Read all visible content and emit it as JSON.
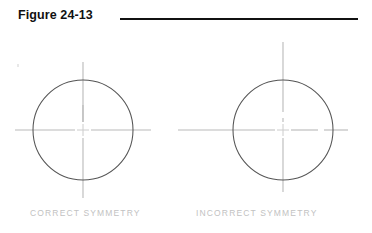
{
  "figure": {
    "title": "Figure 24-13",
    "rule_color": "#111111"
  },
  "captions": {
    "correct": "CORRECT  SYMMETRY",
    "incorrect": "INCORRECT  SYMMETRY"
  },
  "colors": {
    "background": "#ffffff",
    "circle_stroke": "#555555",
    "centerline_stroke": "#b9b9b9",
    "caption_text": "#c2c2c2",
    "title_text": "#111111"
  },
  "diagram": {
    "type": "technical-drawing",
    "units": "pixels",
    "circle_radius": 50,
    "panels": [
      {
        "id": "correct",
        "label": "CORRECT  SYMMETRY",
        "center_x": 83,
        "center_y": 130,
        "radius": 50,
        "centerline_extension": {
          "up": 18,
          "down": 18,
          "left": 18,
          "right": 18
        },
        "symmetric": true,
        "note": "Centerlines project an equal distance past the circle on all four sides."
      },
      {
        "id": "incorrect",
        "label": "INCORRECT  SYMMETRY",
        "center_x": 283,
        "center_y": 130,
        "radius": 50,
        "centerline_extension": {
          "up": 38,
          "down": 24,
          "left": 55,
          "right": 15
        },
        "symmetric": false,
        "note": "Centerlines project unequal distances past the circle, so the crosshair is not symmetric."
      }
    ],
    "centerline_style": {
      "description": "CAD centerline: long dash, short gap, short dash through the center",
      "gap_half_width": 8,
      "inner_dash_length": 9,
      "inner_gap_length": 6
    }
  }
}
